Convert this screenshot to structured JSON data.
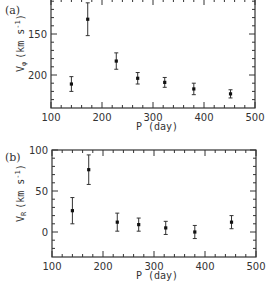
{
  "chart_data": [
    {
      "type": "scatter",
      "panel_label": "(a)",
      "title": "",
      "xlabel": "P (day)",
      "ylabel": "Vφ (km s⁻¹)",
      "xlim": [
        100,
        500
      ],
      "ylim": [
        240,
        108
      ],
      "y_inverted": true,
      "grid": false,
      "xticks": [
        100,
        200,
        300,
        400,
        500
      ],
      "yticks": [
        150,
        200
      ],
      "points": [
        {
          "x": 140,
          "y": 211,
          "err": 9
        },
        {
          "x": 172,
          "y": 132,
          "err": 20
        },
        {
          "x": 228,
          "y": 183,
          "err": 10
        },
        {
          "x": 270,
          "y": 204,
          "err": 7
        },
        {
          "x": 323,
          "y": 209,
          "err": 6
        },
        {
          "x": 380,
          "y": 217,
          "err": 7
        },
        {
          "x": 452,
          "y": 223,
          "err": 5
        }
      ]
    },
    {
      "type": "scatter",
      "panel_label": "(b)",
      "title": "",
      "xlabel": "P (day)",
      "ylabel": "Vᵣ (km s⁻¹)",
      "xlim": [
        100,
        500
      ],
      "ylim": [
        -30,
        100
      ],
      "y_inverted": false,
      "grid": false,
      "xticks": [
        100,
        200,
        300,
        400,
        500
      ],
      "yticks": [
        0,
        50,
        100
      ],
      "points": [
        {
          "x": 140,
          "y": 26,
          "err": 16
        },
        {
          "x": 172,
          "y": 76,
          "err": 18
        },
        {
          "x": 228,
          "y": 12,
          "err": 11
        },
        {
          "x": 270,
          "y": 9,
          "err": 8
        },
        {
          "x": 323,
          "y": 5,
          "err": 8
        },
        {
          "x": 380,
          "y": 0,
          "err": 8
        },
        {
          "x": 452,
          "y": 12,
          "err": 8
        }
      ]
    }
  ],
  "panels": [
    {
      "label": "(a)",
      "ylabel_main": "V",
      "ylabel_sub": "φ",
      "ylabel_units": "(km s",
      "ylabel_exp": "-1",
      "ylabel_close": ")",
      "xlabel": "P (day)",
      "xtick_labels": [
        "100",
        "200",
        "300",
        "400",
        "500"
      ],
      "ytick_labels": [
        "150",
        "200"
      ]
    },
    {
      "label": "(b)",
      "ylabel_main": "V",
      "ylabel_sub": "R",
      "ylabel_units": "(km s",
      "ylabel_exp": "-1",
      "ylabel_close": ")",
      "xlabel": "P (day)",
      "xtick_labels": [
        "100",
        "200",
        "300",
        "400",
        "500"
      ],
      "ytick_labels": [
        "100",
        "50",
        "0"
      ]
    }
  ]
}
